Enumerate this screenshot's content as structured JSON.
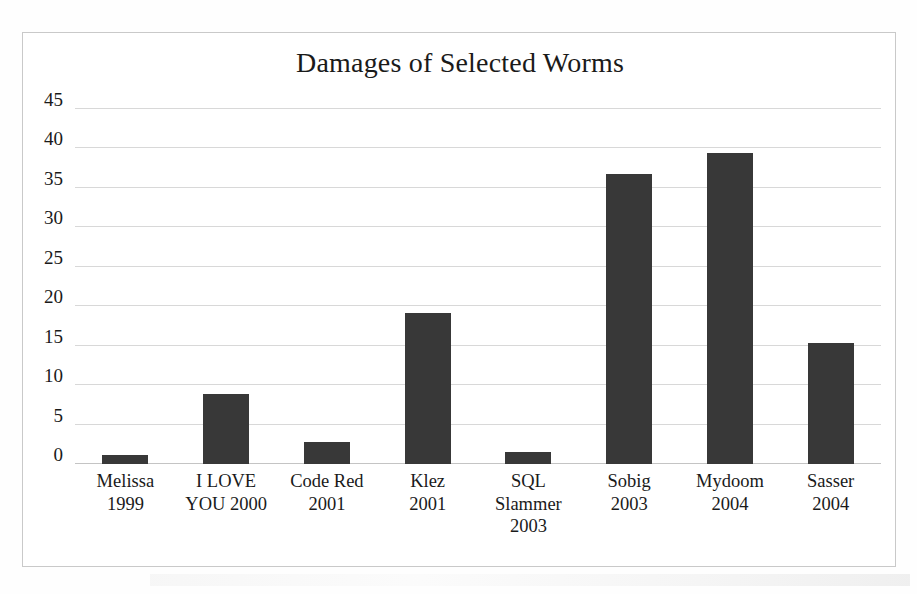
{
  "chart_data": {
    "type": "bar",
    "title": "Damages of Selected Worms",
    "xlabel": "",
    "ylabel": "",
    "ylim": [
      0,
      45
    ],
    "grid": true,
    "legend": "none",
    "orientation": "vertical",
    "bar_color": "#383838",
    "categories": [
      "Melissa 1999",
      "I LOVE YOU 2000",
      "Code Red 2001",
      "Klez 2001",
      "SQL Slammer 2003",
      "Sobig 2003",
      "Mydoom 2004",
      "Sasser 2004"
    ],
    "category_lines": [
      [
        "Melissa",
        "1999"
      ],
      [
        "I LOVE",
        "YOU 2000"
      ],
      [
        "Code Red",
        "2001"
      ],
      [
        "Klez",
        "2001"
      ],
      [
        "SQL",
        "Slammer",
        "2003"
      ],
      [
        "Sobig",
        "2003"
      ],
      [
        "Mydoom",
        "2004"
      ],
      [
        "Sasser",
        "2004"
      ]
    ],
    "values": [
      1.1,
      8.9,
      2.8,
      19.1,
      1.5,
      36.8,
      39.4,
      15.3
    ],
    "yticks": [
      0,
      5,
      10,
      15,
      20,
      25,
      30,
      35,
      40,
      45
    ],
    "ytick_labels": [
      "0",
      "5",
      "10",
      "15",
      "20",
      "25",
      "30",
      "35",
      "40",
      "45"
    ]
  },
  "figure": {
    "background": "#ffffff",
    "frame_color": "#c9c9c9",
    "gridline_color": "#d8d8d8",
    "text_color": "#1a1a1a"
  }
}
